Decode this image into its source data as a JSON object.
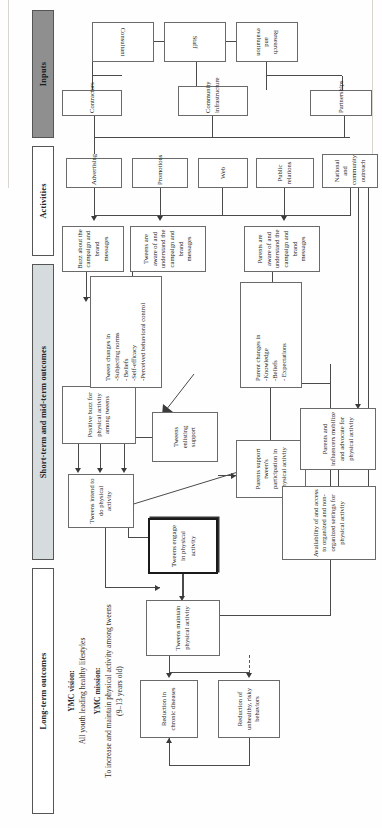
{
  "document": {
    "title": "YMC Logic Model",
    "orientation": "rotated-90",
    "bands": [
      {
        "id": "long-term",
        "label": "Long-term outcomes"
      },
      {
        "id": "short-mid",
        "label": "Short-term and mid-term outcomes"
      },
      {
        "id": "activities",
        "label": "Activities"
      },
      {
        "id": "inputs",
        "label": "Inputs"
      }
    ],
    "mission": {
      "vision_title": "YMC vision:",
      "vision_text": "All youth leading healthy lifestyles",
      "mission_title": "YMC mission:",
      "mission_text": "To increase and maintain physical activity among tweens",
      "mission_detail": "(9–13 years old)"
    },
    "nodes": {
      "reduction_chronic": {
        "label": "Reduction in chronic diseases"
      },
      "reduction_risky": {
        "label": "Reduction of unhealthy, risky behaviors"
      },
      "tweens_maintain": {
        "label": "Tweens maintain physical activity"
      },
      "tweens_engage": {
        "label": "Tweens engage in physical activity",
        "emphasis": "bold-border"
      },
      "tweens_intend": {
        "label": "Tweens intend to do physical activity"
      },
      "positive_buzz": {
        "label": "Positive buzz for physical activity among tweens"
      },
      "tweens_enlisting": {
        "label": "Tweens enlisting support"
      },
      "parents_support": {
        "label": "Parents support tween's participation in physical activity"
      },
      "availability": {
        "label": "Availability of and access to organized and non-organized settings for physical activity"
      },
      "parents_mobilize": {
        "label": "Parents and influencers mobilize and advocate for physical activity"
      },
      "tween_changes": {
        "label": "Tween changes in\n-Subjecting norms\n- Beliefs\n-Self-efficacy\n-Perceived behavioral control"
      },
      "parent_changes": {
        "label": "Parent changes in\n-Knowledge\n-Beliefs\n- Expectations"
      },
      "buzz_campaign": {
        "label": "Buzz about the campaign and brand messages"
      },
      "tweens_aware": {
        "label": "Tweens are aware of and understand the campaign and brand messages"
      },
      "parents_aware": {
        "label": "Parents are aware of and understand the campaign and brand messages"
      },
      "advertising": {
        "label": "Advertising"
      },
      "promotions": {
        "label": "Promotions"
      },
      "web": {
        "label": "Web"
      },
      "public_relations": {
        "label": "Public relations"
      },
      "outreach": {
        "label": "National and community outreach"
      },
      "contractors": {
        "label": "Contractors"
      },
      "community_infra": {
        "label": "Community infrastructure"
      },
      "partnerships": {
        "label": "Partnerships"
      },
      "consultant": {
        "label": "Consultant"
      },
      "staff": {
        "label": "Staff"
      },
      "research_eval": {
        "label": "Research and evaluation"
      }
    },
    "colors": {
      "band_light": "#d6dbde",
      "band_dark": "#8f8f8f",
      "band_white": "#ffffff",
      "box_border": "#6a6a6a",
      "emphasis_border": "#1a1a1a",
      "connector": "#4a4a4a"
    }
  }
}
